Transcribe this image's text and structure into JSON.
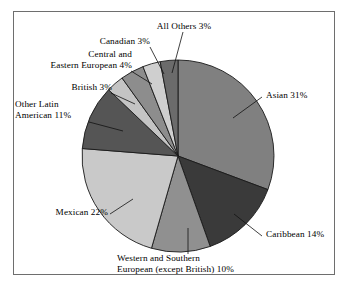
{
  "figure": {
    "frame_border_color": "#6e6e6e",
    "background": "#ffffff"
  },
  "chart_data": {
    "type": "pie",
    "title": "",
    "subtitle": "",
    "xlabel": "",
    "ylabel": "",
    "legend_position": "none",
    "grid": false,
    "units": "percent",
    "total": 100,
    "center": {
      "x": 178,
      "y": 156
    },
    "radius": 96,
    "start_angle_deg": -90,
    "direction": "clockwise",
    "categories": [
      "Asian",
      "Caribbean",
      "Western and Southern European (except British)",
      "Mexican",
      "Other Latin American",
      "British",
      "Central and Eastern European",
      "Canadian",
      "All Others"
    ],
    "values": [
      31,
      14,
      10,
      22,
      11,
      3,
      4,
      3,
      3
    ],
    "colors": [
      "#808080",
      "#3a3a3a",
      "#909090",
      "#c9c9c9",
      "#555555",
      "#c4c4c4",
      "#8d8d8d",
      "#cfcfcf",
      "#6b6b6b"
    ],
    "slice_edge_color": "#1a1a1a",
    "labels": [
      "Asian 31%",
      "Caribbean 14%",
      "Western and Southern European (except British) 10%",
      "Mexican 22%",
      "Other Latin American 11%",
      "British 3%",
      "Central and Eastern European 4%",
      "Canadian 3%",
      "All Others 3%"
    ]
  },
  "labels": {
    "all_others": "All Others 3%",
    "canadian": "Canadian 3%",
    "central_eastern_european_l1": "Central and",
    "central_eastern_european_l2": "Eastern European 4%",
    "british": "British 3%",
    "other_latin_american_l1": "Other Latin",
    "other_latin_american_l2": "American 11%",
    "mexican": "Mexican 22%",
    "asian": "Asian 31%",
    "caribbean": "Caribbean 14%",
    "western_southern_european_l1": "Western and Southern",
    "western_southern_european_l2": "European (except British) 10%"
  },
  "caption": {
    "cropped_text": ""
  }
}
